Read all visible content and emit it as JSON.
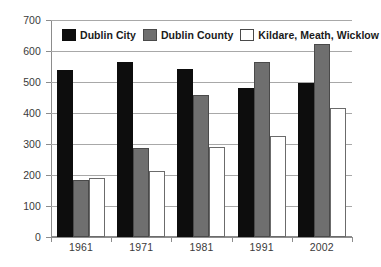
{
  "chart_data": {
    "type": "bar",
    "title": "",
    "subtitle": "",
    "xlabel": "",
    "ylabel": "",
    "categories": [
      "1961",
      "1971",
      "1981",
      "1991",
      "2002"
    ],
    "series": [
      {
        "name": "Dublin City",
        "color": "#0d0d0d",
        "values": [
          538,
          566,
          541,
          481,
          496
        ]
      },
      {
        "name": "Dublin County",
        "color": "#6f6f6f",
        "values": [
          185,
          286,
          458,
          563,
          622
        ]
      },
      {
        "name": "Kildare, Meath, Wicklow",
        "color": "#ffffff",
        "values": [
          190,
          213,
          291,
          327,
          415
        ]
      }
    ],
    "ylim": [
      0,
      700
    ],
    "yticks": [
      0,
      100,
      200,
      300,
      400,
      500,
      600,
      700
    ],
    "ytick_labels": [
      "0",
      "100",
      "200",
      "300",
      "400",
      "500",
      "600",
      "700"
    ],
    "grid": true,
    "grid_axis": "y",
    "legend_position": "top-left-inside",
    "legend": [
      "Dublin City",
      "Dublin County",
      "Kildare, Meath, Wicklow"
    ],
    "annotations": []
  },
  "colors": {
    "series_1": "#0d0d0d",
    "series_2": "#6f6f6f",
    "series_3": "#ffffff",
    "gridline": "#a8a8a8",
    "axis": "#8c8c8c",
    "tick_text": "#3a3a3a",
    "legend_text": "#1a1a1a",
    "background": "#ffffff"
  }
}
